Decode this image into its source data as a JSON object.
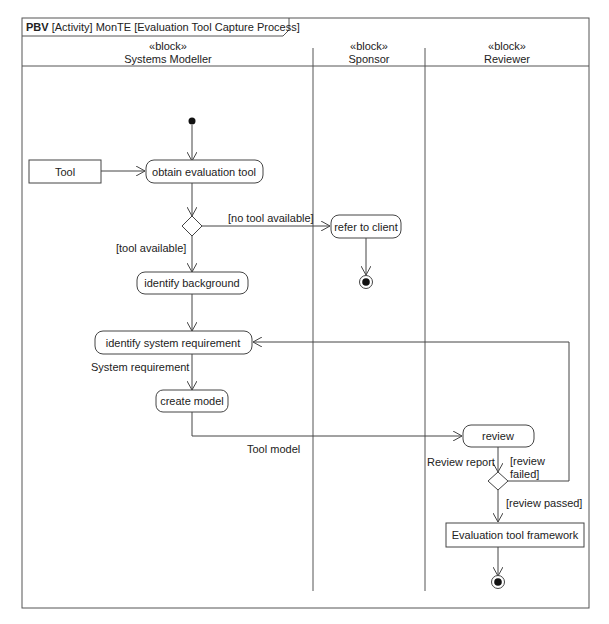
{
  "frame": {
    "kind_bold": "PBV",
    "title_rest": "[Activity] MonTE [Evaluation Tool Capture Process]"
  },
  "lanes": [
    {
      "stereotype": "«block»",
      "name": "Systems Modeller"
    },
    {
      "stereotype": "«block»",
      "name": "Sponsor"
    },
    {
      "stereotype": "«block»",
      "name": "Reviewer"
    }
  ],
  "nodes": {
    "tool_object": "Tool",
    "obtain": "obtain evaluation tool",
    "refer": "refer to client",
    "identify_bg": "identify background",
    "identify_req": "identify system requirement",
    "create_model": "create model",
    "review": "review",
    "framework": "Evaluation tool framework"
  },
  "labels": {
    "no_tool": "[no tool available]",
    "tool_avail": "[tool available]",
    "sys_req": "System requirement",
    "tool_model": "Tool model",
    "review_report": "Review report",
    "review_failed_1": "[review",
    "review_failed_2": "failed]",
    "review_passed": "[review passed]"
  },
  "colors": {
    "line": "#444444",
    "fill": "#ffffff",
    "text": "#222222"
  }
}
